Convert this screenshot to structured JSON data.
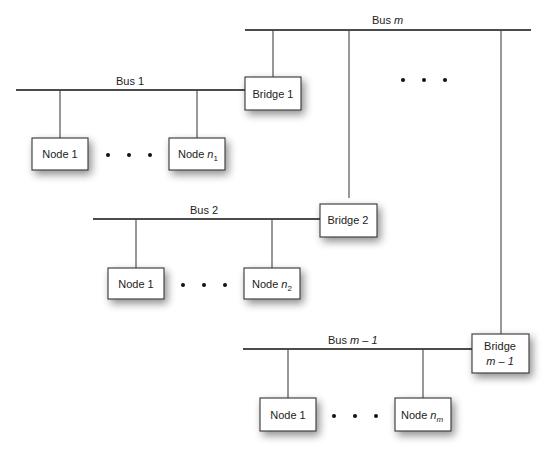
{
  "diagram": {
    "type": "bridged multi-bus network",
    "buses": [
      {
        "id": "bus-m",
        "label": "Bus",
        "label_var": "m"
      },
      {
        "id": "bus-1",
        "label": "Bus 1"
      },
      {
        "id": "bus-2",
        "label": "Bus 2"
      },
      {
        "id": "bus-m-1",
        "label": "Bus",
        "label_var": "m – 1"
      }
    ],
    "bridges": [
      {
        "id": "bridge-1",
        "label": "Bridge 1"
      },
      {
        "id": "bridge-2",
        "label": "Bridge 2"
      },
      {
        "id": "bridge-m-1",
        "label": "Bridge",
        "label_line2": "m – 1"
      }
    ],
    "node_groups": [
      {
        "bus": "bus-1",
        "first": "Node 1",
        "last_prefix": "Node",
        "last_var": "n",
        "last_sub": "1"
      },
      {
        "bus": "bus-2",
        "first": "Node 1",
        "last_prefix": "Node",
        "last_var": "n",
        "last_sub": "2"
      },
      {
        "bus": "bus-m-1",
        "first": "Node 1",
        "last_prefix": "Node",
        "last_var": "n",
        "last_sub": "m"
      }
    ],
    "ellipsis": "• • •"
  }
}
